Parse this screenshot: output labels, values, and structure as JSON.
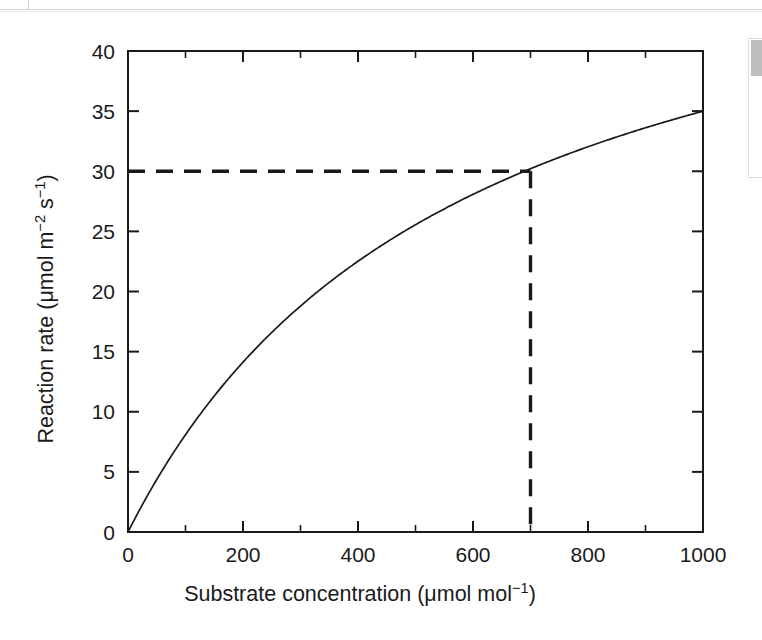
{
  "chart_data": {
    "type": "line",
    "title": "",
    "xlabel": "Substrate concentration (μmol mol⁻¹)",
    "ylabel": "Reaction rate (μmol m⁻² s⁻¹)",
    "xlim": [
      0,
      1000
    ],
    "ylim": [
      0,
      40
    ],
    "grid": false,
    "legend": null,
    "x_ticks": [
      0,
      200,
      400,
      600,
      800,
      1000
    ],
    "x_tick_labels": [
      "0",
      "200",
      "400",
      "600",
      "800",
      "1000"
    ],
    "x_minor_ticks": [
      100,
      300,
      500,
      700,
      900
    ],
    "y_ticks": [
      0,
      5,
      10,
      15,
      20,
      25,
      30,
      35,
      40
    ],
    "y_tick_labels": [
      "0",
      "5",
      "10",
      "15",
      "20",
      "25",
      "30",
      "35",
      "40"
    ],
    "series": [
      {
        "name": "Reaction rate",
        "style": "solid",
        "color": "#1a1a1a",
        "model": "Michaelis-Menten",
        "vmax": 55.5,
        "km": 586,
        "x": [
          0,
          50,
          100,
          150,
          200,
          250,
          300,
          350,
          400,
          450,
          500,
          550,
          600,
          650,
          700,
          750,
          800,
          850,
          900,
          950,
          1000
        ],
        "y": [
          0,
          4.4,
          8.1,
          11.3,
          14.1,
          16.6,
          18.8,
          20.8,
          22.5,
          24.1,
          25.6,
          26.9,
          28.1,
          29.1,
          30.0,
          31.0,
          31.8,
          32.6,
          33.3,
          34.0,
          34.6
        ]
      }
    ],
    "annotations": [
      {
        "name": "guide-lines",
        "style": "dashed",
        "color": "#1a1a1a",
        "point": {
          "x": 700,
          "y": 30
        },
        "horizontal_from_x": 0,
        "vertical_to_y": 0
      }
    ]
  }
}
